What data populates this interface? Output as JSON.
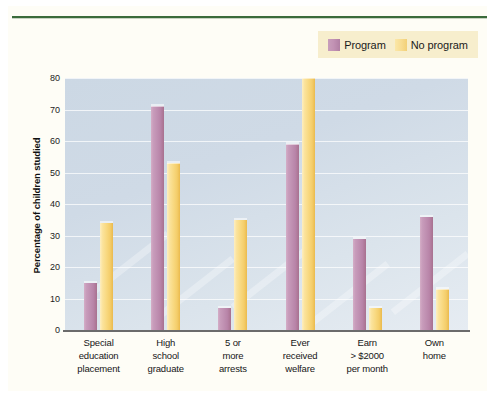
{
  "figure": {
    "background_color": "#fefdf6",
    "rule_color": "#3b6b3b"
  },
  "legend": {
    "background_color": "#f7eecd",
    "entries": [
      {
        "label": "Program",
        "color": "#bf8fb1",
        "swatch": "program-swatch"
      },
      {
        "label": "No program",
        "color": "#f8d87f",
        "swatch": "no-program-swatch"
      }
    ]
  },
  "axes": {
    "ylabel": "Percentage of children studied",
    "yticks": [
      "0",
      "10",
      "20",
      "30",
      "40",
      "50",
      "60",
      "70",
      "80"
    ],
    "ytick_values": [
      0,
      10,
      20,
      30,
      40,
      50,
      60,
      70,
      80
    ]
  },
  "chart_data": {
    "type": "bar",
    "title": "",
    "xlabel": "",
    "ylabel": "Percentage of children studied",
    "ylim": [
      0,
      80
    ],
    "grid": true,
    "legend_position": "top-right",
    "categories": [
      "Special education placement",
      "High school graduate",
      "5 or more arrests",
      "Ever received welfare",
      "Earn > $2000 per month",
      "Own home"
    ],
    "category_lines": [
      [
        "Special",
        "education",
        "placement"
      ],
      [
        "High",
        "school",
        "graduate"
      ],
      [
        "5 or",
        "more",
        "arrests"
      ],
      [
        "Ever",
        "received",
        "welfare"
      ],
      [
        "Earn",
        "> $2000",
        "per month"
      ],
      [
        "Own",
        "home"
      ]
    ],
    "series": [
      {
        "name": "Program",
        "color": "#bf8fb1",
        "values": [
          15,
          71,
          7,
          59,
          29,
          36
        ]
      },
      {
        "name": "No program",
        "color": "#f8d87f",
        "values": [
          34,
          53,
          35,
          80,
          7,
          13
        ]
      }
    ]
  }
}
